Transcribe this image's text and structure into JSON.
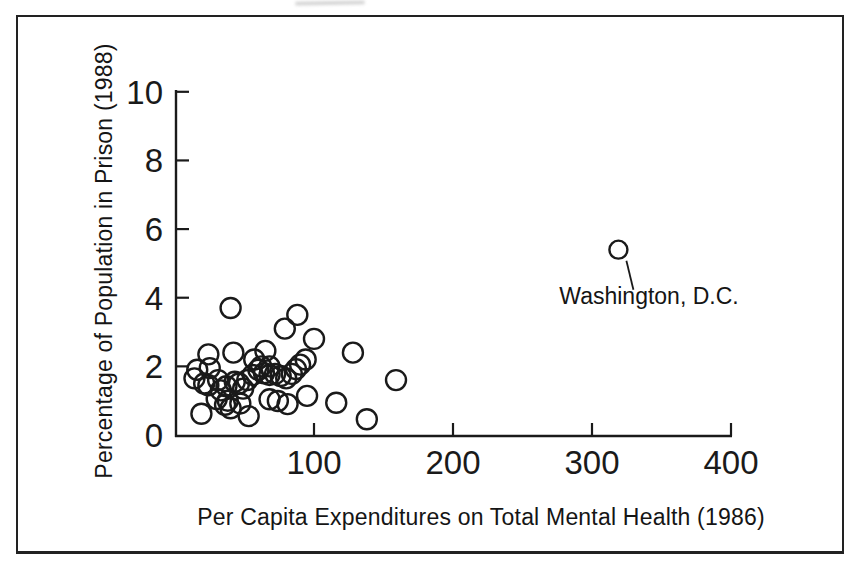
{
  "colors": {
    "ink": "#1a1a1a",
    "paper": "#ffffff"
  },
  "chart_data": {
    "type": "scatter",
    "title": "",
    "xlabel": "Per Capita Expenditures on Total Mental Health (1986)",
    "ylabel": "Percentage of Population in Prison (1988)",
    "xlim": [
      0,
      400
    ],
    "ylim": [
      0,
      10
    ],
    "x_ticks": [
      100,
      200,
      300,
      400
    ],
    "y_ticks": [
      0,
      2,
      4,
      6,
      8,
      10
    ],
    "grid": false,
    "legend": "none",
    "marker": "open-circle",
    "series": [
      {
        "name": "states",
        "points": [
          [
            40,
            3.7
          ],
          [
            88,
            3.5
          ],
          [
            79,
            3.1
          ],
          [
            100,
            2.8
          ],
          [
            128,
            2.4
          ],
          [
            24,
            2.35
          ],
          [
            42,
            2.4
          ],
          [
            57,
            2.2
          ],
          [
            65,
            2.45
          ],
          [
            16,
            1.9
          ],
          [
            25,
            1.95
          ],
          [
            14,
            1.65
          ],
          [
            21,
            1.5
          ],
          [
            24,
            1.45
          ],
          [
            31,
            1.6
          ],
          [
            33,
            1.3
          ],
          [
            37,
            1.42
          ],
          [
            43,
            1.55
          ],
          [
            46,
            1.5
          ],
          [
            49,
            1.35
          ],
          [
            52,
            1.6
          ],
          [
            56,
            1.75
          ],
          [
            60,
            1.9
          ],
          [
            62,
            2.0
          ],
          [
            64,
            1.8
          ],
          [
            68,
            2.0
          ],
          [
            68,
            1.75
          ],
          [
            72,
            1.78
          ],
          [
            76,
            1.72
          ],
          [
            80,
            1.65
          ],
          [
            84,
            1.78
          ],
          [
            87,
            1.92
          ],
          [
            90,
            2.05
          ],
          [
            94,
            2.2
          ],
          [
            30,
            1.05
          ],
          [
            38,
            1.0
          ],
          [
            36,
            0.88
          ],
          [
            40,
            0.78
          ],
          [
            47,
            0.92
          ],
          [
            68,
            1.04
          ],
          [
            74,
            0.99
          ],
          [
            81,
            0.9
          ],
          [
            95,
            1.14
          ],
          [
            116,
            0.94
          ],
          [
            19,
            0.62
          ],
          [
            53,
            0.55
          ],
          [
            138,
            0.46
          ],
          [
            159,
            1.6
          ]
        ]
      },
      {
        "name": "outlier",
        "points": [
          [
            319,
            5.4
          ]
        ]
      }
    ],
    "annotation": {
      "text": "Washington, D.C.",
      "target": [
        319,
        5.4
      ]
    }
  }
}
